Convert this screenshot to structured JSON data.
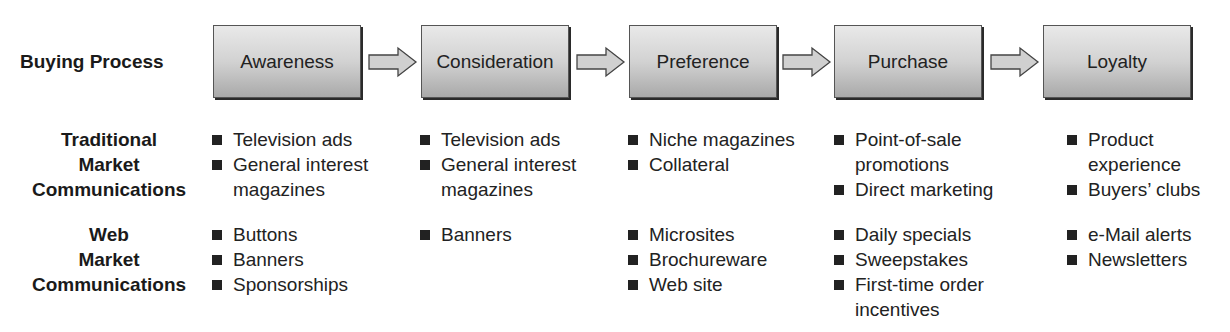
{
  "rows": {
    "buying_process": "Buying Process",
    "traditional": [
      "Traditional",
      "Market",
      "Communications"
    ],
    "web": [
      "Web",
      "Market",
      "Communications"
    ]
  },
  "stages": [
    "Awareness",
    "Consideration",
    "Preference",
    "Purchase",
    "Loyalty"
  ],
  "traditional_items": [
    [
      "Television ads",
      "General interest magazines"
    ],
    [
      "Television ads",
      "General interest magazines"
    ],
    [
      "Niche magazines",
      "Collateral"
    ],
    [
      "Point-of-sale promotions",
      "Direct marketing"
    ],
    [
      "Product experience",
      "Buyers’ clubs"
    ]
  ],
  "web_items": [
    [
      "Buttons",
      "Banners",
      "Sponsorships"
    ],
    [
      "Banners"
    ],
    [
      "Microsites",
      "Brochureware",
      "Web site"
    ],
    [
      "Daily specials",
      "Sweepstakes",
      "First-time order incentives"
    ],
    [
      "e-Mail alerts",
      "Newsletters"
    ]
  ],
  "colors": {
    "box_top": "#e9e9e9",
    "box_bottom": "#a9a9a9",
    "bullet": "#222222",
    "arrow_fill": "#d0d0d0"
  }
}
